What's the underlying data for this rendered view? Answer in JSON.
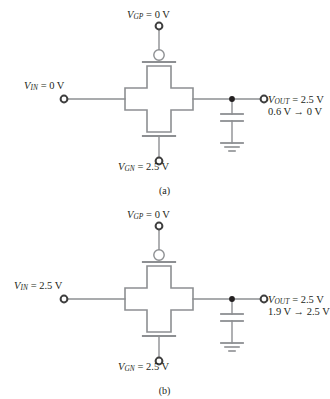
{
  "figure": {
    "type": "circuit-diagram",
    "panels": [
      {
        "id": "a",
        "caption": "(a)",
        "labels": {
          "gate_p": {
            "symbol": "V",
            "subscript": "GP",
            "text": " = 0 V"
          },
          "gate_n": {
            "symbol": "V",
            "subscript": "GN",
            "text": " = 2.5 V"
          },
          "input": {
            "symbol": "V",
            "subscript": "IN",
            "text": " = 0 V"
          },
          "output_line1": {
            "symbol": "V",
            "subscript": "OUT",
            "text": " = 2.5 V"
          },
          "output_line2": {
            "text": "0.6 V → 0 V"
          }
        },
        "components": {
          "pmos_gate_icon": "bubble-gate",
          "nmos_gate_icon": "plain-gate",
          "pass_gate_icon": "cross-transmission-gate",
          "load_icon": "capacitor",
          "reference_icon": "ground"
        }
      },
      {
        "id": "b",
        "caption": "(b)",
        "labels": {
          "gate_p": {
            "symbol": "V",
            "subscript": "GP",
            "text": " = 0 V"
          },
          "gate_n": {
            "symbol": "V",
            "subscript": "GN",
            "text": " = 2.5 V"
          },
          "input": {
            "symbol": "V",
            "subscript": "IN",
            "text": " = 2.5 V"
          },
          "output_line1": {
            "symbol": "V",
            "subscript": "OUT",
            "text": " = 2.5 V"
          },
          "output_line2": {
            "text": "1.9 V → 2.5 V"
          }
        },
        "components": {
          "pmos_gate_icon": "bubble-gate",
          "nmos_gate_icon": "plain-gate",
          "pass_gate_icon": "cross-transmission-gate",
          "load_icon": "capacitor",
          "reference_icon": "ground"
        }
      }
    ],
    "colors": {
      "wire": "#8d8f92",
      "outline": "#8d8f92",
      "text": "#231f20",
      "node_fill": "#231f20",
      "background": "#ffffff"
    }
  }
}
